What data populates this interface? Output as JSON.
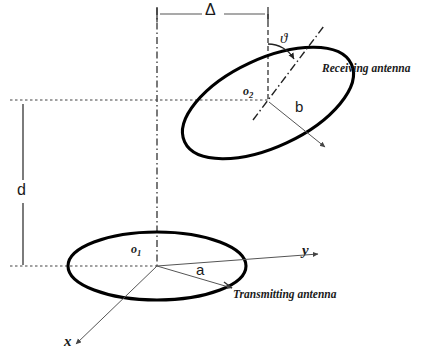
{
  "figure": {
    "colors": {
      "ink": "#1a1a1a",
      "ellipse_stroke": "#000000",
      "thin_line": "#555555",
      "dash_line": "#333333",
      "background": "#ffffff"
    },
    "labels": {
      "delta": "Δ",
      "theta": "ϑ",
      "receiving_antenna": "Receiving antenna",
      "transmitting_antenna": "Transmitting antenna",
      "origin_2": "o",
      "origin_2_sub": "2",
      "origin_1": "o",
      "origin_1_sub": "1",
      "semi_axis_b": "b",
      "semi_axis_a": "a",
      "separation_d": "d",
      "axis_x": "x",
      "axis_y": "y"
    },
    "geometry": {
      "receiving_ellipse": {
        "center_x": 268,
        "center_y": 103,
        "radius_x": 92,
        "radius_y": 44,
        "rotation_deg": -25
      },
      "transmitting_ellipse": {
        "center_x": 157,
        "center_y": 266,
        "radius_x": 89,
        "radius_y": 34,
        "rotation_deg": 0
      },
      "delta_dimension": {
        "y": 14,
        "x_start": 157,
        "x_end": 268
      },
      "d_dimension": {
        "x": 23,
        "y_start": 104,
        "y_end": 265
      },
      "vertical_center_line_x": 157,
      "upper_horizontal_line_y": 100,
      "lower_horizontal_line_y": 266
    }
  }
}
